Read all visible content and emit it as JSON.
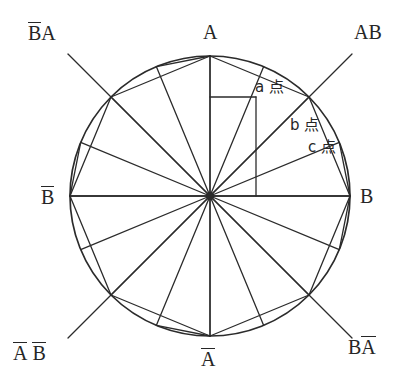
{
  "figure": {
    "colors": {
      "stroke": "#2b2b2b",
      "text": "#262626",
      "background": "#ffffff"
    },
    "circle": {
      "cx": 210,
      "cy": 196,
      "r": 140
    },
    "center_dot": {
      "cx": 210,
      "cy": 196,
      "r": 4
    },
    "labels": {
      "top": {
        "text": "A",
        "overline": false,
        "x": 203,
        "y": 22
      },
      "right": {
        "text": "B",
        "overline": false,
        "x": 360,
        "y": 186
      },
      "bottom": {
        "text": "A",
        "overline": true,
        "x": 201,
        "y": 348
      },
      "left": {
        "text": "B",
        "overline": true,
        "x": 41,
        "y": 186
      },
      "top_left": {
        "text": "BA",
        "overline_first": true,
        "x": 28,
        "y": 22
      },
      "top_right": {
        "text": "AB",
        "overline": false,
        "x": 354,
        "y": 22
      },
      "bottom_left": {
        "text": "A B",
        "overline_both": true,
        "x": 13,
        "y": 342
      },
      "bottom_right": {
        "text": "BA",
        "overline_second": true,
        "x": 348,
        "y": 336
      }
    },
    "annotations": [
      {
        "id": "a",
        "text": "a 点",
        "x": 255,
        "y": 80
      },
      {
        "id": "b",
        "text": "b 点",
        "x": 290,
        "y": 118
      },
      {
        "id": "c",
        "text": "c 点",
        "x": 308,
        "y": 140
      }
    ],
    "axes": {
      "vertical": {
        "x1": 210,
        "y1": 56,
        "x2": 210,
        "y2": 336
      },
      "horizontal": {
        "x1": 70,
        "y1": 196,
        "x2": 350,
        "y2": 196
      }
    },
    "diagonals": [
      {
        "name": "BA-to-BA-bar",
        "x1": 68,
        "y1": 54,
        "x2": 352,
        "y2": 338
      },
      {
        "name": "AB-to-A-bar-B-bar",
        "x1": 352,
        "y1": 54,
        "x2": 68,
        "y2": 338
      }
    ],
    "spoke_count": 16,
    "spoke_step_degrees": 22.5,
    "rect": {
      "x": 210,
      "y": 97,
      "w": 46,
      "h": 99
    },
    "chords": [
      {
        "from": "A",
        "to": "NW-octant-point"
      },
      {
        "from": "B-bar",
        "to": "NW-octant-point"
      },
      {
        "from": "B-bar",
        "to": "SW-octant-point"
      },
      {
        "from": "A-bar",
        "to": "SW-octant-point"
      },
      {
        "from": "A-bar",
        "to": "SE-octant-point"
      },
      {
        "from": "B",
        "to": "SE-octant-point"
      },
      {
        "from": "B",
        "to": "NE-octant-point"
      },
      {
        "from": "A",
        "to": "NE-octant-point"
      }
    ]
  }
}
